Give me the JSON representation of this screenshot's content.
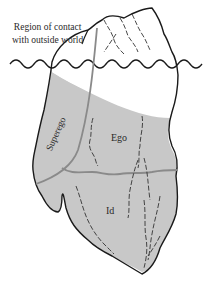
{
  "diagram": {
    "labels": {
      "contact_line1": "Region of contact",
      "contact_line2": "with outside world",
      "superego": "Superego",
      "ego": "Ego",
      "id": "Id"
    },
    "colors": {
      "outline": "#1a1a1a",
      "submerged_fill": "#c8c8c8",
      "above_water_fill": "#ffffff",
      "region_divider": "#8a8a8a",
      "crack_lines": "#333333",
      "text": "#2a2a2a"
    },
    "regions": [
      "Region of contact with outside world",
      "Superego",
      "Ego",
      "Id"
    ]
  }
}
